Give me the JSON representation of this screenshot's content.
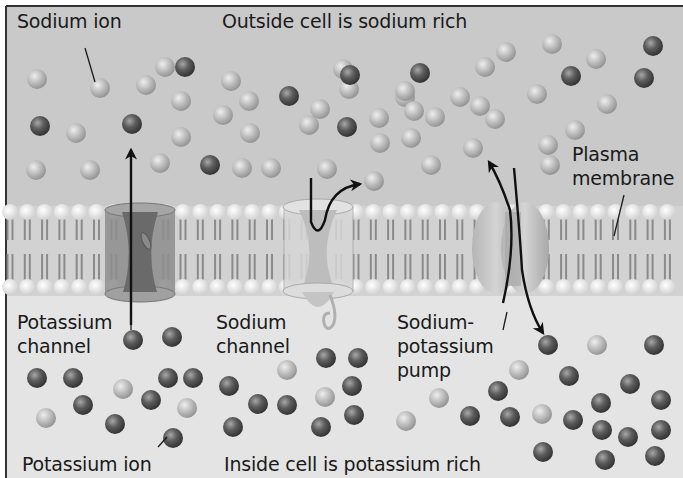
{
  "colors": {
    "outside_bg": "#c9c9c9",
    "inside_bg": "#e4e4e4",
    "membrane_bg": "#d2d2d2",
    "sodium_ion": "#b9b9b9",
    "potassium_ion": "#5e5e5e",
    "border": "#333333",
    "text": "#1a1a1a"
  },
  "labels": {
    "sodium_ion": "Sodium ion",
    "outside_cell": "Outside cell is sodium rich",
    "plasma_membrane_1": "Plasma",
    "plasma_membrane_2": "membrane",
    "potassium_channel_1": "Potassium",
    "potassium_channel_2": "channel",
    "sodium_channel_1": "Sodium",
    "sodium_channel_2": "channel",
    "pump_1": "Sodium-",
    "pump_2": "potassium",
    "pump_3": "pump",
    "potassium_ion": "Potassium ion",
    "inside_cell": "Inside cell is potassium rich"
  },
  "regions": {
    "outside": "Outside cell",
    "membrane": "Plasma membrane (phospholipid bilayer)",
    "inside": "Inside cell"
  },
  "structures": [
    {
      "name": "Potassium channel",
      "x": 133
    },
    {
      "name": "Sodium channel",
      "x": 318
    },
    {
      "name": "Sodium-potassium pump",
      "x": 505
    }
  ],
  "ions": {
    "outside_sodium": [
      [
        37,
        79
      ],
      [
        100,
        88
      ],
      [
        146,
        85
      ],
      [
        181,
        101
      ],
      [
        165,
        67
      ],
      [
        231,
        81
      ],
      [
        249,
        101
      ],
      [
        223,
        115
      ],
      [
        181,
        137
      ],
      [
        250,
        133
      ],
      [
        320,
        109
      ],
      [
        343,
        69
      ],
      [
        76,
        133
      ],
      [
        36,
        170
      ],
      [
        90,
        170
      ],
      [
        160,
        163
      ],
      [
        242,
        168
      ],
      [
        271,
        168
      ],
      [
        309,
        125
      ],
      [
        327,
        169
      ],
      [
        349,
        89
      ],
      [
        379,
        118
      ],
      [
        380,
        143
      ],
      [
        405,
        97
      ],
      [
        414,
        111
      ],
      [
        460,
        97
      ],
      [
        480,
        106
      ],
      [
        485,
        67
      ],
      [
        495,
        119
      ],
      [
        506,
        52
      ],
      [
        537,
        94
      ],
      [
        552,
        44
      ],
      [
        575,
        130
      ],
      [
        596,
        59
      ],
      [
        607,
        104
      ],
      [
        548,
        145
      ],
      [
        550,
        165
      ],
      [
        435,
        117
      ],
      [
        431,
        165
      ],
      [
        411,
        138
      ],
      [
        405,
        91
      ],
      [
        473,
        148
      ],
      [
        374,
        181
      ]
    ],
    "outside_potassium": [
      [
        185,
        67
      ],
      [
        40,
        126
      ],
      [
        132,
        124
      ],
      [
        210,
        165
      ],
      [
        289,
        96
      ],
      [
        350,
        75
      ],
      [
        347,
        127
      ],
      [
        420,
        73
      ],
      [
        571,
        76
      ],
      [
        653,
        46
      ],
      [
        644,
        78
      ]
    ],
    "inside_sodium": [
      [
        123,
        389
      ],
      [
        46,
        418
      ],
      [
        187,
        408
      ],
      [
        287,
        370
      ],
      [
        325,
        397
      ],
      [
        406,
        421
      ],
      [
        439,
        398
      ],
      [
        519,
        370
      ],
      [
        542,
        414
      ],
      [
        597,
        345
      ]
    ],
    "inside_potassium": [
      [
        133,
        340
      ],
      [
        172,
        337
      ],
      [
        37,
        378
      ],
      [
        73,
        378
      ],
      [
        168,
        378
      ],
      [
        193,
        378
      ],
      [
        83,
        405
      ],
      [
        151,
        400
      ],
      [
        115,
        424
      ],
      [
        173,
        438
      ],
      [
        229,
        386
      ],
      [
        258,
        404
      ],
      [
        287,
        405
      ],
      [
        326,
        358
      ],
      [
        358,
        358
      ],
      [
        352,
        386
      ],
      [
        354,
        415
      ],
      [
        321,
        427
      ],
      [
        233,
        427
      ],
      [
        470,
        416
      ],
      [
        498,
        391
      ],
      [
        510,
        417
      ],
      [
        548,
        345
      ],
      [
        569,
        376
      ],
      [
        573,
        420
      ],
      [
        601,
        403
      ],
      [
        630,
        384
      ],
      [
        654,
        345
      ],
      [
        661,
        400
      ],
      [
        661,
        430
      ],
      [
        602,
        430
      ],
      [
        628,
        437
      ],
      [
        543,
        452
      ],
      [
        605,
        460
      ],
      [
        655,
        456
      ]
    ]
  }
}
